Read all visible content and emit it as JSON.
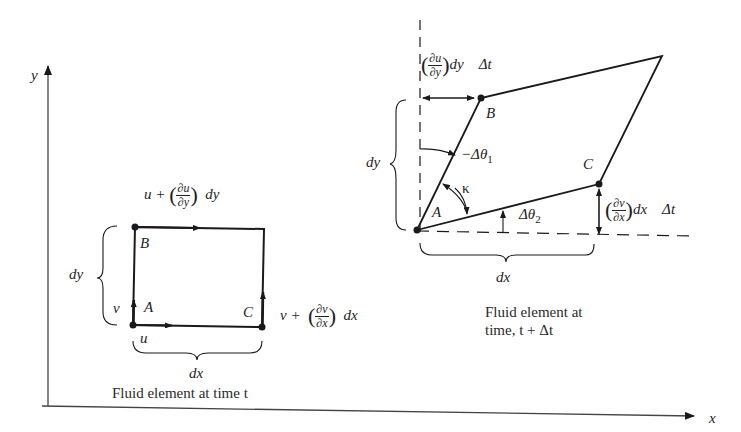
{
  "axes": {
    "x_label": "x",
    "y_label": "y"
  },
  "left_element": {
    "points": {
      "A": "A",
      "B": "B",
      "C": "C"
    },
    "top_velocity": {
      "base": "u +",
      "num": "∂u",
      "den": "∂y",
      "factor": "dy"
    },
    "right_velocity": {
      "base": "v +",
      "num": "∂v",
      "den": "∂x",
      "factor": "dx"
    },
    "left_velocity": "v",
    "bottom_velocity": "u",
    "height_label": "dy",
    "width_label": "dx",
    "caption": "Fluid element at time t"
  },
  "right_element": {
    "points": {
      "A": "A",
      "B": "B",
      "C": "C"
    },
    "top_displacement": {
      "num": "∂u",
      "den": "∂y",
      "factor": "dy",
      "dt": "Δt"
    },
    "right_displacement": {
      "num": "∂v",
      "den": "∂x",
      "factor": "dx",
      "dt": "Δt"
    },
    "angle1": "−Δθ",
    "angle1_sub": "1",
    "angle2": "Δθ",
    "angle2_sub": "2",
    "kappa": "κ",
    "height_label": "dy",
    "width_label": "dx",
    "caption_line1": "Fluid element at",
    "caption_line2": "time, t + Δt"
  },
  "colors": {
    "ink": "#1a1a1a",
    "background": "#ffffff"
  }
}
